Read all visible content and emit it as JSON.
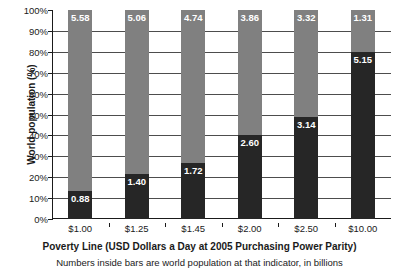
{
  "chart_data": {
    "type": "bar",
    "stacked": true,
    "title": "",
    "xlabel": "Poverty Line (USD Dollars a Day at 2005 Purchasing Power Parity)",
    "sublabel": "Numbers inside bars are world population at that indicator, in billions",
    "ylabel": "World population (%)",
    "ylim": [
      0,
      100
    ],
    "ytick_labels": [
      "100%",
      "90%",
      "80%",
      "70%",
      "60%",
      "50%",
      "40%",
      "30%",
      "20%",
      "10%",
      "0%"
    ],
    "ytick_values": [
      100,
      90,
      80,
      70,
      60,
      50,
      40,
      30,
      20,
      10,
      0
    ],
    "grid": true,
    "legend": "none",
    "categories": [
      "$1.00",
      "$1.25",
      "$1.45",
      "$2.00",
      "$2.50",
      "$10.00"
    ],
    "series": [
      {
        "name": "Below poverty line",
        "color": "#262626",
        "values_billions": [
          0.88,
          1.4,
          1.72,
          2.6,
          3.14,
          5.15
        ],
        "values_percent": [
          13.6,
          21.7,
          26.6,
          40.2,
          48.6,
          79.7
        ]
      },
      {
        "name": "Above poverty line",
        "color": "#808080",
        "values_billions": [
          5.58,
          5.06,
          4.74,
          3.86,
          3.32,
          1.31
        ],
        "values_percent": [
          86.4,
          78.3,
          73.4,
          59.8,
          51.4,
          20.3
        ]
      }
    ],
    "bars": [
      {
        "category": "$1.00",
        "below_label": "0.88",
        "above_label": "5.58",
        "below_percent": 13.6,
        "above_percent": 86.4
      },
      {
        "category": "$1.25",
        "below_label": "1.40",
        "above_label": "5.06",
        "below_percent": 21.7,
        "above_percent": 78.3
      },
      {
        "category": "$1.45",
        "below_label": "1.72",
        "above_label": "4.74",
        "below_percent": 26.6,
        "above_percent": 73.4
      },
      {
        "category": "$2.00",
        "below_label": "2.60",
        "above_label": "3.86",
        "below_percent": 40.2,
        "above_percent": 59.8
      },
      {
        "category": "$2.50",
        "below_label": "3.14",
        "above_label": "3.32",
        "below_percent": 48.6,
        "above_percent": 51.4
      },
      {
        "category": "$10.00",
        "below_label": "5.15",
        "above_label": "1.31",
        "below_percent": 79.7,
        "above_percent": 20.3
      }
    ],
    "colors": {
      "below_poverty": "#262626",
      "above_poverty": "#808080",
      "axis": "#1a1a1a",
      "gridline": "#4d4d4d",
      "background": "#ffffff",
      "bar_label_text": "#ffffff"
    }
  }
}
